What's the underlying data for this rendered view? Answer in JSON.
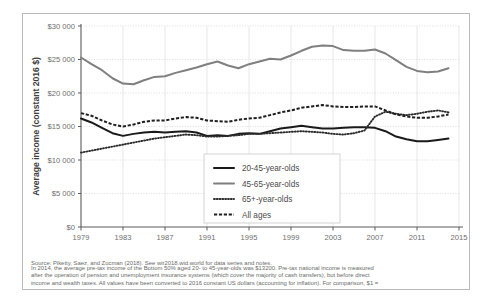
{
  "figure": {
    "source_line": "Source: Piketty, Saez, and Zucman (2018). See wir2018.wid.world for data series and notes.",
    "caption_lines": [
      "In 2014, the average pre-tax income of the Bottom 50% aged 20- to 45-year-olds was $13200. Pre-tax national income is measured",
      "after the operation of pension and unemployment insurance systems (which cover the majority of cash transfers), but before direct",
      "income and wealth taxes. All values have been converted to 2016 constant US dollars (accounting for inflation). For comparison, $1 ="
    ]
  },
  "chart_data": {
    "type": "line",
    "title": "",
    "xlabel": "",
    "ylabel": "Average income (constant 2016 $)",
    "xlim": [
      1979,
      2015
    ],
    "ylim": [
      0,
      30000
    ],
    "yticks": [
      0,
      5000,
      10000,
      15000,
      20000,
      25000,
      30000
    ],
    "ytick_labels": [
      "$0",
      "$5 000",
      "$10 000",
      "$15 000",
      "$20 000",
      "$25 000",
      "$30 000"
    ],
    "xticks": [
      1979,
      1983,
      1987,
      1991,
      1995,
      1999,
      2003,
      2007,
      2011,
      2015
    ],
    "xtick_labels": [
      "1979",
      "1983",
      "1987",
      "1991",
      "1995",
      "1999",
      "2003",
      "2007",
      "2011",
      "2015"
    ],
    "grid": true,
    "legend_position": "bottom-center",
    "x": [
      1979,
      1980,
      1981,
      1982,
      1983,
      1984,
      1985,
      1986,
      1987,
      1988,
      1989,
      1990,
      1991,
      1992,
      1993,
      1994,
      1995,
      1996,
      1997,
      1998,
      1999,
      2000,
      2001,
      2002,
      2003,
      2004,
      2005,
      2006,
      2007,
      2008,
      2009,
      2010,
      2011,
      2012,
      2013,
      2014
    ],
    "series": [
      {
        "name": "20-45-year-olds",
        "color": "#1a1a1a",
        "style": "solid",
        "values": [
          16200,
          15600,
          14800,
          14000,
          13600,
          13900,
          14100,
          14200,
          14100,
          14200,
          14300,
          14100,
          13600,
          13700,
          13600,
          13900,
          14000,
          13900,
          14300,
          14700,
          14900,
          15100,
          14900,
          14700,
          14700,
          14800,
          14900,
          14900,
          14800,
          14300,
          13500,
          13100,
          12800,
          12800,
          13000,
          13200
        ]
      },
      {
        "name": "45-65-year-olds",
        "color": "#7f7f7f",
        "style": "solid",
        "values": [
          25300,
          24300,
          23400,
          22200,
          21400,
          21300,
          21900,
          22400,
          22500,
          23000,
          23400,
          23800,
          24300,
          24700,
          24100,
          23700,
          24300,
          24700,
          25100,
          25000,
          25600,
          26300,
          26900,
          27100,
          27000,
          26400,
          26300,
          26300,
          26500,
          25900,
          24900,
          23900,
          23300,
          23100,
          23200,
          23700
        ]
      },
      {
        "name": "65+-year-olds",
        "color": "#2b2b2b",
        "style": "dotted",
        "values": [
          11100,
          11400,
          11700,
          12000,
          12300,
          12600,
          12900,
          13200,
          13400,
          13600,
          13800,
          13700,
          13500,
          13500,
          13600,
          13700,
          13900,
          13900,
          14000,
          14100,
          14200,
          14300,
          14200,
          14100,
          13900,
          13800,
          14000,
          14400,
          16500,
          17200,
          16900,
          16700,
          16900,
          17200,
          17400,
          17100
        ]
      },
      {
        "name": "All ages",
        "color": "#1f1f1f",
        "style": "dashed",
        "values": [
          17000,
          16600,
          15900,
          15300,
          15000,
          15300,
          15700,
          15900,
          15900,
          16200,
          16400,
          16300,
          15900,
          15800,
          15700,
          16000,
          16200,
          16300,
          16700,
          17100,
          17400,
          17800,
          18000,
          18200,
          18000,
          17900,
          17900,
          18000,
          18000,
          17400,
          16800,
          16500,
          16300,
          16300,
          16500,
          16800
        ]
      }
    ]
  },
  "legend": {
    "items": [
      {
        "label": "20-45-year-olds",
        "swatch": "solid-dark"
      },
      {
        "label": "45-65-year-olds",
        "swatch": "solid-gray"
      },
      {
        "label": "65+-year-olds",
        "swatch": "dotted"
      },
      {
        "label": "All ages",
        "swatch": "dashed"
      }
    ]
  }
}
